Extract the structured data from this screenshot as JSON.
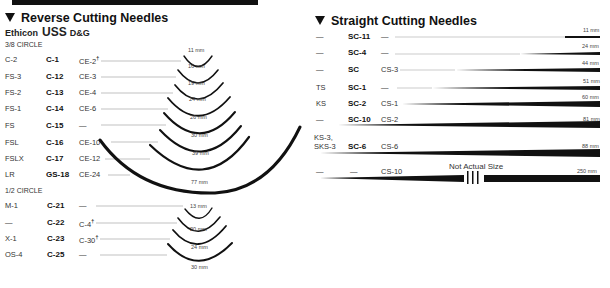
{
  "reverse": {
    "title": "Reverse Cutting Needles",
    "brands": {
      "a": "Ethicon",
      "b": "USS",
      "c": "D&G"
    },
    "circle38": {
      "label": "3/8 CIRCLE",
      "rows": [
        {
          "ethicon": "C-2",
          "uss": "C-1",
          "dg": "CE-2",
          "dagger": true,
          "size": "11 mm"
        },
        {
          "ethicon": "FS-3",
          "uss": "C-12",
          "dg": "CE-3",
          "dagger": false,
          "size": "16 mm"
        },
        {
          "ethicon": "FS-2",
          "uss": "C-13",
          "dg": "CE-4",
          "dagger": false,
          "size": "19 mm"
        },
        {
          "ethicon": "FS-1",
          "uss": "C-14",
          "dg": "CE-6",
          "dagger": false,
          "size": "24 mm"
        },
        {
          "ethicon": "FS",
          "uss": "C-15",
          "dg": "—",
          "dagger": false,
          "size": "26 mm"
        },
        {
          "ethicon": "FSL",
          "uss": "C-16",
          "dg": "CE-10",
          "dagger": false,
          "size": "30 mm"
        },
        {
          "ethicon": "FSLX",
          "uss": "C-17",
          "dg": "CE-12",
          "dagger": false,
          "size": "39 mm"
        },
        {
          "ethicon": "LR",
          "uss": "GS-18",
          "dg": "CE-24",
          "dagger": false,
          "size": "77 mm"
        }
      ]
    },
    "circle12": {
      "label": "1/2 CIRCLE",
      "rows": [
        {
          "ethicon": "M-1",
          "uss": "C-21",
          "dg": "—",
          "dagger": false,
          "size": "13 mm"
        },
        {
          "ethicon": "—",
          "uss": "C-22",
          "dg": "C-4",
          "dagger": true,
          "size": "20 mm"
        },
        {
          "ethicon": "X-1",
          "uss": "C-23",
          "dg": "C-30",
          "dagger": true,
          "size": "24 mm"
        },
        {
          "ethicon": "OS-4",
          "uss": "C-25",
          "dg": "—",
          "dagger": false,
          "size": "30 mm"
        }
      ]
    }
  },
  "straight": {
    "title": "Straight Cutting Needles",
    "rows": [
      {
        "ethicon": "—",
        "uss": "SC-11",
        "dg": "—",
        "size": "11 mm"
      },
      {
        "ethicon": "—",
        "uss": "SC-4",
        "dg": "—",
        "size": "24 mm"
      },
      {
        "ethicon": "—",
        "uss": "SC",
        "dg": "CS-3",
        "size": "44 mm"
      },
      {
        "ethicon": "TS",
        "uss": "SC-1",
        "dg": "—",
        "size": "51 mm"
      },
      {
        "ethicon": "KS",
        "uss": "SC-2",
        "dg": "CS-1",
        "size": "60 mm"
      },
      {
        "ethicon": "—",
        "uss": "SC-10",
        "dg": "CS-2",
        "size": "81 mm"
      },
      {
        "ethicon": "KS-3,\nSKS-3",
        "uss": "SC-6",
        "dg": "CS-6",
        "size": "88 mm"
      },
      {
        "ethicon": "—",
        "uss": "—",
        "dg": "CS-10",
        "size": "250 mm"
      }
    ],
    "note": "Not Actual Size"
  }
}
